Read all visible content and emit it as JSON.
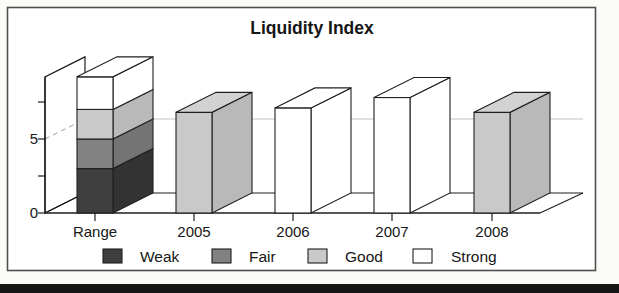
{
  "figure": {
    "kind": "scanned-textbook-chart",
    "colors": {
      "weak": "#3f3f3f",
      "weak_side": "#333333",
      "fair": "#828282",
      "fair_side": "#747474",
      "good": "#c9c9c9",
      "good_side": "#b9b9b9",
      "good_top": "#d2d2d2",
      "strong": "#ffffff",
      "strong_side": "#ffffff",
      "strong_top": "#ffffff",
      "outline": "#1f1f1f",
      "gridline": "#c4c4c4",
      "grid_dash": "#b2b2b2",
      "text": "#161616",
      "page_band": "#151515",
      "plot_background": "#ffffff"
    }
  },
  "chart_data": {
    "type": "bar",
    "projection": "3d",
    "title": "Liquidity Index",
    "categories": [
      "Range",
      "2005",
      "2006",
      "2007",
      "2008"
    ],
    "range_stack": [
      {
        "label": "Weak",
        "from": 0,
        "to": 3
      },
      {
        "label": "Fair",
        "from": 3,
        "to": 5
      },
      {
        "label": "Good",
        "from": 5,
        "to": 7
      },
      {
        "label": "Strong",
        "from": 7,
        "to": 9.2
      }
    ],
    "series": [
      {
        "name": "Liquidity Index",
        "values": [
          null,
          6.8,
          7.1,
          7.8,
          6.8
        ]
      }
    ],
    "bar_ratings": [
      null,
      "Good",
      "Strong",
      "Strong",
      "Good"
    ],
    "ylim": [
      0,
      9.2
    ],
    "yticks": [
      0,
      2.5,
      5,
      7.5
    ],
    "ytick_labels": [
      {
        "value": 0,
        "label": "0"
      },
      {
        "value": 5,
        "label": "5"
      }
    ],
    "gridline_value": 5,
    "grid": "single-horizontal-backwall",
    "legend_position": "bottom",
    "legend": [
      {
        "label": "Weak",
        "color_key": "weak"
      },
      {
        "label": "Fair",
        "color_key": "fair"
      },
      {
        "label": "Good",
        "color_key": "good"
      },
      {
        "label": "Strong",
        "color_key": "strong"
      }
    ]
  }
}
